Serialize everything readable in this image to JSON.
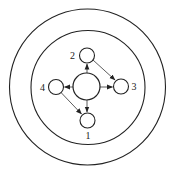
{
  "diagram": {
    "type": "concentric-circle-node-diagram",
    "canvas": {
      "width": 173,
      "height": 181,
      "background": "#ffffff"
    },
    "stroke_color": "#222222",
    "rings": [
      {
        "id": "outer-ring",
        "cx": 87.5,
        "cy": 87,
        "r": 78
      },
      {
        "id": "inner-ring",
        "cx": 88,
        "cy": 87.5,
        "r": 57
      }
    ],
    "center": {
      "id": "center-hub",
      "cx": 86.5,
      "cy": 86.5,
      "r": 13.5
    },
    "nodes": [
      {
        "id": "1",
        "label": "1",
        "cx": 87.5,
        "cy": 120.5,
        "r": 7.5,
        "label_x": 88,
        "label_y": 139
      },
      {
        "id": "2",
        "label": "2",
        "cx": 87,
        "cy": 55.5,
        "r": 7.5,
        "label_x": 72.5,
        "label_y": 59
      },
      {
        "id": "3",
        "label": "3",
        "cx": 121,
        "cy": 86.5,
        "r": 7.5,
        "label_x": 134,
        "label_y": 90
      },
      {
        "id": "4",
        "label": "4",
        "cx": 56,
        "cy": 87,
        "r": 7.5,
        "label_x": 42.5,
        "label_y": 91
      }
    ],
    "edges": [
      {
        "from": "center",
        "to": "2",
        "x1": 87,
        "y1": 86.5,
        "x2": 87,
        "y2": 64,
        "arrow": "end"
      },
      {
        "from": "center",
        "to": "1",
        "x1": 87,
        "y1": 86.5,
        "x2": 87,
        "y2": 112,
        "arrow": "end"
      },
      {
        "from": "center",
        "to": "4",
        "x1": 86.5,
        "y1": 87,
        "x2": 64.5,
        "y2": 87,
        "arrow": "end"
      },
      {
        "from": "center",
        "to": "3",
        "x1": 86.5,
        "y1": 87,
        "x2": 112.5,
        "y2": 87,
        "arrow": "end"
      },
      {
        "from": "2",
        "to": "3",
        "x1": 93,
        "y1": 60,
        "x2": 115,
        "y2": 80,
        "arrow": "end"
      },
      {
        "from": "4",
        "to": "1",
        "x1": 61.5,
        "y1": 93,
        "x2": 81.5,
        "y2": 114,
        "arrow": "end"
      }
    ]
  }
}
